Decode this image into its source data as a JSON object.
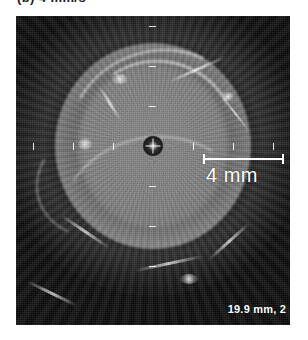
{
  "figure": {
    "caption": "(b) 4 mm/s"
  },
  "image": {
    "modality": "intravascular-ultrasound",
    "background_color": "#0a0a0a",
    "annotation_color": "#ffffff"
  },
  "scale": {
    "bar_label": "4 mm",
    "bar_length_px": 81,
    "bar_value": 4,
    "bar_units": "mm"
  },
  "readout": {
    "depth": "19.9 mm, 2"
  },
  "graticule": {
    "horizontal_ticks": [
      -3,
      -2,
      -1,
      1,
      2,
      3
    ],
    "vertical_ticks": [
      -3,
      -2,
      -1,
      1,
      2,
      3
    ],
    "tick_spacing_px": 40
  },
  "markers": {
    "transducer_center": "crosshair"
  }
}
